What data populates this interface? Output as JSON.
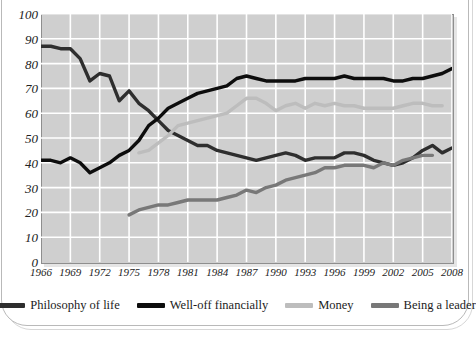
{
  "chart_data": {
    "type": "line",
    "title": "",
    "subtitle": "",
    "xlabel": "",
    "ylabel": "",
    "xlim": [
      1966,
      2008
    ],
    "ylim": [
      0,
      100
    ],
    "grid": true,
    "legend_position": "bottom",
    "x_tick_labels": [
      "1966",
      "1969",
      "1972",
      "1975",
      "1978",
      "1981",
      "1984",
      "1987",
      "1990",
      "1993",
      "1996",
      "1999",
      "2002",
      "2005",
      "2008"
    ],
    "y_tick_labels": [
      "100",
      "90",
      "80",
      "70",
      "60",
      "50",
      "40",
      "30",
      "20",
      "10",
      "0"
    ],
    "x": [
      1966,
      1967,
      1968,
      1969,
      1970,
      1971,
      1972,
      1973,
      1974,
      1975,
      1976,
      1977,
      1978,
      1979,
      1980,
      1981,
      1982,
      1983,
      1984,
      1985,
      1986,
      1987,
      1988,
      1989,
      1990,
      1991,
      1992,
      1993,
      1994,
      1995,
      1996,
      1997,
      1998,
      1999,
      2000,
      2001,
      2002,
      2003,
      2004,
      2005,
      2006,
      2007,
      2008
    ],
    "series": [
      {
        "name": "Philosophy of life",
        "color": "#2e2e2e",
        "x": [
          1966,
          1967,
          1968,
          1969,
          1970,
          1971,
          1972,
          1973,
          1974,
          1975,
          1976,
          1977,
          1978,
          1979,
          1980,
          1981,
          1982,
          1983,
          1984,
          1985,
          1986,
          1987,
          1988,
          1989,
          1990,
          1991,
          1992,
          1993,
          1994,
          1995,
          1996,
          1997,
          1998,
          1999,
          2000,
          2001,
          2002,
          2003,
          2004,
          2005,
          2006,
          2007,
          2008
        ],
        "values": [
          87,
          87,
          86,
          86,
          82,
          73,
          76,
          75,
          65,
          69,
          64,
          61,
          57,
          53,
          51,
          49,
          47,
          47,
          45,
          44,
          43,
          42,
          41,
          42,
          43,
          44,
          43,
          41,
          42,
          42,
          42,
          44,
          44,
          43,
          41,
          40,
          39,
          40,
          42,
          45,
          47,
          44,
          46
        ]
      },
      {
        "name": "Well-off financially",
        "color": "#0d0d0d",
        "x": [
          1966,
          1967,
          1968,
          1969,
          1970,
          1971,
          1972,
          1973,
          1974,
          1975,
          1976,
          1977,
          1978,
          1979,
          1980,
          1981,
          1982,
          1983,
          1984,
          1985,
          1986,
          1987,
          1988,
          1989,
          1990,
          1991,
          1992,
          1993,
          1994,
          1995,
          1996,
          1997,
          1998,
          1999,
          2000,
          2001,
          2002,
          2003,
          2004,
          2005,
          2006,
          2007,
          2008
        ],
        "values": [
          41,
          41,
          40,
          42,
          40,
          36,
          38,
          40,
          43,
          45,
          49,
          55,
          58,
          62,
          64,
          66,
          68,
          69,
          70,
          71,
          74,
          75,
          74,
          73,
          73,
          73,
          73,
          74,
          74,
          74,
          74,
          75,
          74,
          74,
          74,
          74,
          73,
          73,
          74,
          74,
          75,
          76,
          78
        ]
      },
      {
        "name": "Money",
        "color": "#bdbdbd",
        "x": [
          1976,
          1977,
          1978,
          1979,
          1980,
          1981,
          1982,
          1983,
          1984,
          1985,
          1986,
          1987,
          1988,
          1989,
          1990,
          1991,
          1992,
          1993,
          1994,
          1995,
          1996,
          1997,
          1998,
          1999,
          2000,
          2001,
          2002,
          2003,
          2004,
          2005,
          2006,
          2007
        ],
        "values": [
          44,
          45,
          48,
          51,
          55,
          56,
          57,
          58,
          59,
          60,
          63,
          66,
          66,
          64,
          61,
          63,
          64,
          62,
          64,
          63,
          64,
          63,
          63,
          62,
          62,
          62,
          62,
          63,
          64,
          64,
          63,
          63
        ]
      },
      {
        "name": "Being a leader",
        "color": "#787878",
        "x": [
          1975,
          1976,
          1977,
          1978,
          1979,
          1980,
          1981,
          1982,
          1983,
          1984,
          1985,
          1986,
          1987,
          1988,
          1989,
          1990,
          1991,
          1992,
          1993,
          1994,
          1995,
          1996,
          1997,
          1998,
          1999,
          2000,
          2001,
          2002,
          2003,
          2004,
          2005,
          2006
        ],
        "values": [
          19,
          21,
          22,
          23,
          23,
          24,
          25,
          25,
          25,
          25,
          26,
          27,
          29,
          28,
          30,
          31,
          33,
          34,
          35,
          36,
          38,
          38,
          39,
          39,
          39,
          38,
          40,
          39,
          41,
          42,
          43,
          43
        ]
      }
    ]
  },
  "legend": {
    "items": [
      {
        "label": "Philosophy of life",
        "color": "#2e2e2e"
      },
      {
        "label": "Well-off financially",
        "color": "#0d0d0d"
      },
      {
        "label": "Money",
        "color": "#bdbdbd"
      },
      {
        "label": "Being a leader",
        "color": "#787878"
      }
    ]
  },
  "axes": {
    "y_ticks": [
      "100",
      "90",
      "80",
      "70",
      "60",
      "50",
      "40",
      "30",
      "20",
      "10",
      "0"
    ],
    "x_ticks": [
      "1966",
      "1969",
      "1972",
      "1975",
      "1978",
      "1981",
      "1984",
      "1987",
      "1990",
      "1993",
      "1996",
      "1999",
      "2002",
      "2005",
      "2008"
    ]
  },
  "colors": {
    "plot_background": "#cfcfcf",
    "gridline": "#ffffff",
    "plot_border": "#8e8e8e",
    "page_background": "#ffffff",
    "frame_border": "#b9b9b9"
  }
}
